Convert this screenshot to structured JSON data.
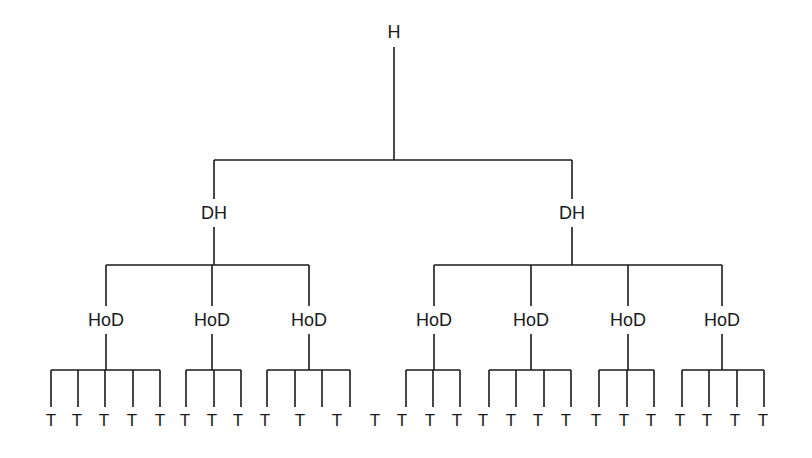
{
  "diagram": {
    "type": "organizational-hierarchy-tree",
    "line_color": "#1a1a1a",
    "background": "#ffffff",
    "root": {
      "label": "H",
      "x": 394,
      "y": 32,
      "children": [
        {
          "label": "DH",
          "x": 214,
          "y": 213,
          "children": [
            {
              "label": "HoD",
              "x": 106,
              "y": 320,
              "branch_x": [
                51,
                78,
                105,
                133,
                160
              ]
            },
            {
              "label": "HoD",
              "x": 212,
              "y": 320,
              "branch_x": [
                186,
                214,
                241
              ]
            },
            {
              "label": "HoD",
              "x": 309,
              "y": 320,
              "branch_x": [
                267,
                295,
                322,
                350
              ]
            }
          ]
        },
        {
          "label": "DH",
          "x": 572,
          "y": 213,
          "children": [
            {
              "label": "HoD",
              "x": 434,
              "y": 320,
              "branch_x": [
                406,
                433,
                460
              ]
            },
            {
              "label": "HoD",
              "x": 531,
              "y": 320,
              "branch_x": [
                489,
                516,
                544,
                571
              ]
            },
            {
              "label": "HoD",
              "x": 628,
              "y": 320,
              "branch_x": [
                599,
                627,
                654
              ]
            },
            {
              "label": "HoD",
              "x": 722,
              "y": 320,
              "branch_x": [
                682,
                709,
                737,
                764
              ]
            }
          ]
        }
      ]
    },
    "leaf_label": "T",
    "leaves_x": [
      51,
      77,
      104,
      132,
      160,
      185,
      212,
      238,
      265,
      300,
      337,
      375,
      402,
      430,
      457,
      483,
      511,
      538,
      566,
      596,
      624,
      651,
      680,
      707,
      735,
      763
    ],
    "leaf_y": 420,
    "leaf_count": 26
  }
}
